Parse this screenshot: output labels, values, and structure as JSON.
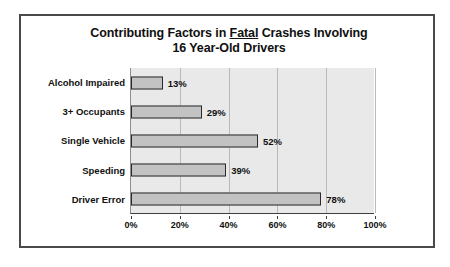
{
  "chart_data": {
    "type": "bar",
    "orientation": "horizontal",
    "title": "Contributing Factors in Fatal Crashes Involving 16 Year-Old Drivers",
    "title_line1_pre": "Contributing Factors in ",
    "title_line1_underlined": "Fatal",
    "title_line1_post": " Crashes Involving",
    "title_line2": "16 Year-Old Drivers",
    "xlabel": "",
    "ylabel": "",
    "categories": [
      "Alcohol Impaired",
      "3+ Occupants",
      "Single Vehicle",
      "Speeding",
      "Driver Error"
    ],
    "values": [
      13,
      29,
      52,
      39,
      78
    ],
    "value_labels": [
      "13%",
      "29%",
      "52%",
      "39%",
      "78%"
    ],
    "xlim": [
      0,
      100
    ],
    "xticks": [
      0,
      20,
      40,
      60,
      80,
      100
    ],
    "xtick_labels": [
      "0%",
      "20%",
      "40%",
      "60%",
      "80%",
      "100%"
    ],
    "grid": true,
    "grid_axis": "x",
    "legend": false,
    "colors": {
      "bar_fill": "#c2c2c2",
      "bar_border": "#2a2a2a",
      "plot_background": "#e9e9e9",
      "gridline": "#b9b9b9",
      "axis": "#3f3f3f",
      "frame": "#4a4a4a",
      "text": "#101010",
      "page_background": "#ffffff"
    }
  }
}
